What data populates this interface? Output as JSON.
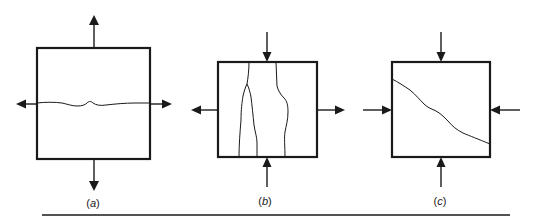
{
  "figure": {
    "panels": [
      {
        "id": "a",
        "label": "(a)",
        "label_letter": "a",
        "loading": "biaxial tension (vertical and horizontal outward arrows)",
        "crack_orientation": "horizontal"
      },
      {
        "id": "b",
        "label": "(b)",
        "label_letter": "b",
        "loading": "vertical compression with lateral tension",
        "crack_orientation": "vertical (splitting)"
      },
      {
        "id": "c",
        "label": "(c)",
        "label_letter": "c",
        "loading": "biaxial compression (all arrows inward)",
        "crack_orientation": "diagonal (shear)"
      }
    ],
    "colors": {
      "stroke": "#1a1a1a",
      "background": "#ffffff"
    }
  }
}
